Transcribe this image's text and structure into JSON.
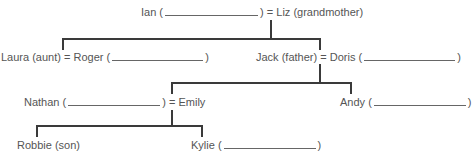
{
  "tree": {
    "generation1": {
      "left": {
        "name": "Ian",
        "open": "(",
        "close": ")",
        "blank_width": 95
      },
      "equals": "=",
      "right": {
        "name": "Liz",
        "relation": "(grandmother)"
      }
    },
    "generation2": {
      "couple_left": {
        "left": {
          "name": "Laura",
          "relation": "(aunt)"
        },
        "equals": "=",
        "right": {
          "name": "Roger",
          "open": "(",
          "close": ")",
          "blank_width": 92
        }
      },
      "couple_right": {
        "left": {
          "name": "Jack",
          "relation": "(father)"
        },
        "equals": "=",
        "right": {
          "name": "Doris",
          "open": "(",
          "close": ")",
          "blank_width": 92
        }
      }
    },
    "generation3": {
      "couple": {
        "left": {
          "name": "Nathan",
          "open": "(",
          "close": ")",
          "blank_width": 92
        },
        "equals": "=",
        "right": {
          "name": "Emily"
        }
      },
      "single": {
        "name": "Andy",
        "open": "(",
        "close": ")",
        "blank_width": 92
      }
    },
    "generation4": {
      "child1": {
        "name": "Robbie",
        "relation": "(son)"
      },
      "child2": {
        "name": "Kylie",
        "open": "(",
        "close": ")",
        "blank_width": 92
      }
    }
  },
  "colors": {
    "text": "#555555",
    "lines": "#3a3a3a",
    "blank_underline": "#666666"
  }
}
